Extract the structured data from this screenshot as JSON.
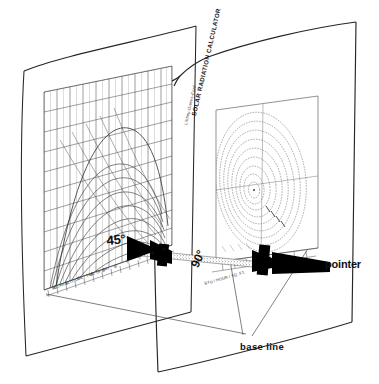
{
  "figure": {
    "kind": "technical-line-diagram",
    "subject": "Solar Radiation Calculator",
    "background_color": "#ffffff",
    "line_color": "#262626",
    "grid_color": "#5a5a5a",
    "contour_color": "#6e6e6e",
    "arrow_color": "#000000"
  },
  "device": {
    "title": "SOLAR RADIATION CALCULATOR",
    "subtitle": "Libbey-Owens-Ford"
  },
  "annotations": {
    "angle_left": "45°",
    "angle_right": "90°",
    "pointer": "pointer",
    "base_line": "base line"
  },
  "panels": {
    "left": {
      "name": "sun-path-grid-chart",
      "axis_caption": "SOLAR ALTITUDE / TIME OF DAY",
      "tick_labels": [
        "90",
        "80",
        "70",
        "60",
        "50",
        "40",
        "30",
        "20",
        "10",
        "0"
      ]
    },
    "right": {
      "name": "radiation-contour-chart",
      "axis_caption": "BTU / HOUR / SQ. FT.",
      "contour_count": 9
    }
  },
  "leaders": {
    "base_line_targets": 2,
    "pointer_target": 1
  }
}
